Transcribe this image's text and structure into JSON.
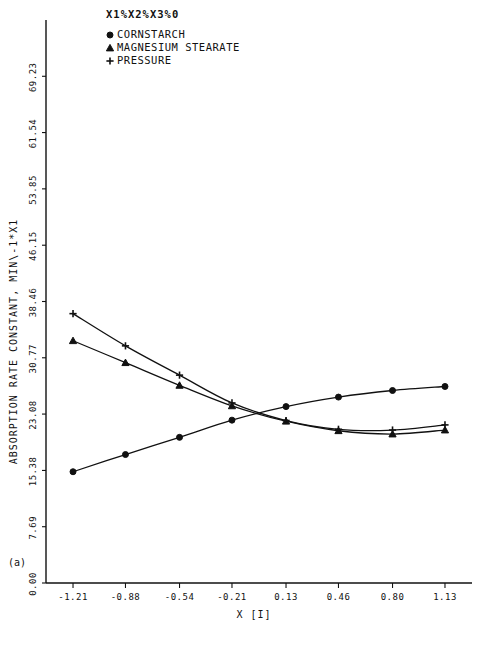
{
  "figure": {
    "panel_label": "(a)",
    "legend_title": "X1%X2%X3%0",
    "caption": ""
  },
  "chart_data": {
    "type": "line",
    "title": "X1%X2%X3%0",
    "xlabel": "X [I]",
    "ylabel": "ABSORPTION RATE CONSTANT, MIN\\-1*X1",
    "xlim": [
      -1.38,
      1.3
    ],
    "ylim": [
      0.0,
      76.92
    ],
    "grid": false,
    "legend_position": "top-left",
    "xticks": [
      "-1.21",
      "-0.88",
      "-0.54",
      "-0.21",
      "0.13",
      "0.46",
      "0.80",
      "1.13"
    ],
    "xtick_values": [
      -1.21,
      -0.88,
      -0.54,
      -0.21,
      0.13,
      0.46,
      0.8,
      1.13
    ],
    "yticks": [
      "0.00",
      "7.69",
      "15.38",
      "23.08",
      "30.77",
      "38.46",
      "46.15",
      "53.85",
      "61.54",
      "69.23"
    ],
    "ytick_values": [
      0.0,
      7.69,
      15.38,
      23.08,
      30.77,
      38.46,
      46.15,
      53.85,
      61.54,
      69.23
    ],
    "series": [
      {
        "name": "CORNSTARCH",
        "marker": "circle-open",
        "legend_glyph": "circle",
        "x": [
          -1.21,
          -0.88,
          -0.54,
          -0.21,
          0.13,
          0.46,
          0.8,
          1.13
        ],
        "values": [
          15.2,
          17.55,
          19.9,
          22.25,
          24.1,
          25.4,
          26.3,
          26.85
        ]
      },
      {
        "name": "MAGNESIUM STEARATE",
        "marker": "triangle",
        "legend_glyph": "triangle",
        "x": [
          -1.21,
          -0.88,
          -0.54,
          -0.21,
          0.13,
          0.46,
          0.8,
          1.13
        ],
        "values": [
          33.1,
          30.1,
          27.0,
          24.2,
          22.1,
          20.8,
          20.35,
          20.9
        ]
      },
      {
        "name": "PRESSURE",
        "marker": "plus",
        "legend_glyph": "plus",
        "x": [
          -1.21,
          -0.88,
          -0.54,
          -0.21,
          0.13,
          0.46,
          0.8,
          1.13
        ],
        "values": [
          36.8,
          32.4,
          28.4,
          24.6,
          22.2,
          21.0,
          20.9,
          21.6
        ]
      }
    ]
  }
}
